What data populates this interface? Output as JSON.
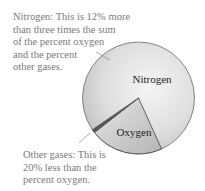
{
  "annotations": {
    "nitrogen": {
      "lines": [
        "Nitrogen: This is 12% more",
        "than three times the sum",
        "of the percent oxygen",
        "and the percent",
        "other gases."
      ]
    },
    "other_gases": {
      "lines": [
        "Other gases: This is",
        "20% less than the",
        "percent oxygen."
      ]
    }
  },
  "pie": {
    "slices": [
      {
        "label": "Nitrogen",
        "approx_percent": 78,
        "color": "#d9d9d9"
      },
      {
        "label": "Oxygen",
        "approx_percent": 21,
        "color": "#c4c4c4"
      },
      {
        "label": "",
        "approx_percent": 1,
        "color": "#555555"
      }
    ],
    "labels": {
      "nitrogen": "Nitrogen",
      "oxygen": "Oxygen"
    },
    "colors": {
      "outline": "#6a6a6a",
      "text": "#7a7a7a"
    }
  }
}
